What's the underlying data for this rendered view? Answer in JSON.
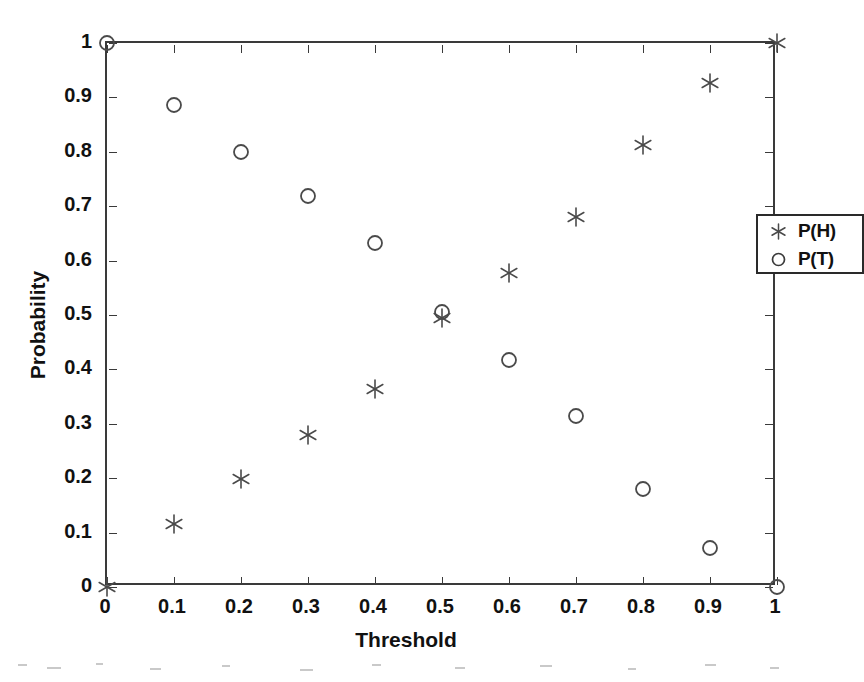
{
  "figure": {
    "background_color": "#ffffff",
    "axis_color": "#3a3a3a",
    "marker_color": "#4a4a4a"
  },
  "chart_data": {
    "type": "scatter",
    "title": "",
    "subtitle": "",
    "xlabel": "Threshold",
    "ylabel": "Probability",
    "xlim": [
      0,
      1
    ],
    "ylim": [
      0,
      1
    ],
    "grid": false,
    "legend_position": "right-upper-inside",
    "x_tick_labels": [
      "0",
      "0.1",
      "0.2",
      "0.3",
      "0.4",
      "0.5",
      "0.6",
      "0.7",
      "0.8",
      "0.9",
      "1"
    ],
    "x_tick_values": [
      0,
      0.1,
      0.2,
      0.3,
      0.4,
      0.5,
      0.6,
      0.7,
      0.8,
      0.9,
      1
    ],
    "y_tick_labels": [
      "0",
      "0.1",
      "0.2",
      "0.3",
      "0.4",
      "0.5",
      "0.6",
      "0.7",
      "0.8",
      "0.9",
      "1"
    ],
    "y_tick_values": [
      0,
      0.1,
      0.2,
      0.3,
      0.4,
      0.5,
      0.6,
      0.7,
      0.8,
      0.9,
      1
    ],
    "x": [
      0,
      0.1,
      0.2,
      0.3,
      0.4,
      0.5,
      0.6,
      0.7,
      0.8,
      0.9,
      1
    ],
    "series": [
      {
        "name": "P(H)",
        "marker": "asterisk",
        "color": "#4a4a4a",
        "values": [
          0,
          0.116,
          0.199,
          0.28,
          0.364,
          0.494,
          0.577,
          0.68,
          0.812,
          0.926,
          1
        ]
      },
      {
        "name": "P(T)",
        "marker": "circle",
        "color": "#4a4a4a",
        "values": [
          1,
          0.886,
          0.8,
          0.719,
          0.632,
          0.505,
          0.417,
          0.314,
          0.18,
          0.072,
          0
        ]
      }
    ],
    "legend": [
      {
        "label": "P(H)",
        "marker": "asterisk"
      },
      {
        "label": "P(T)",
        "marker": "circle"
      }
    ]
  }
}
